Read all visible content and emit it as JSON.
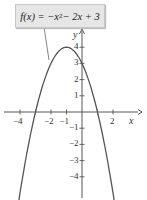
{
  "chart_data": {
    "type": "line",
    "function": "f(x) = -x^2 - 2x + 3",
    "label": {
      "prefix": "f(x) = −x",
      "exp": "2",
      "suffix": " − 2x + 3"
    },
    "xlabel": "x",
    "ylabel": "y",
    "xlim": [
      -4.9,
      4.1
    ],
    "ylim": [
      -5.2,
      5.1
    ],
    "x_ticks": [
      -4,
      -3,
      -2,
      -1,
      1,
      2
    ],
    "x_tick_labels": [
      "−4",
      "−2",
      "−1",
      "2"
    ],
    "x_tick_label_values": [
      -4,
      -2,
      -1,
      2
    ],
    "y_ticks": [
      -4,
      -3,
      -2,
      -1,
      1,
      2,
      3,
      4
    ],
    "y_tick_labels": [
      "4",
      "3",
      "2",
      "1",
      "−1",
      "−2",
      "−3",
      "−4"
    ],
    "y_tick_label_values": [
      4,
      3,
      2,
      1,
      -1,
      -2,
      -3,
      -4
    ],
    "vertex": [
      -1,
      4
    ],
    "x_intercepts": [
      -3,
      1
    ],
    "y_intercept": 3,
    "series": [
      {
        "name": "f(x)",
        "x": [
          -4.8,
          -4,
          -3,
          -2,
          -1,
          0,
          1,
          2,
          2.8
        ],
        "values": [
          -10.44,
          -5,
          0,
          3,
          4,
          3,
          0,
          -5,
          -10.44
        ]
      }
    ],
    "grid": false,
    "line_color": "#555555",
    "axis_color": "#444444"
  }
}
